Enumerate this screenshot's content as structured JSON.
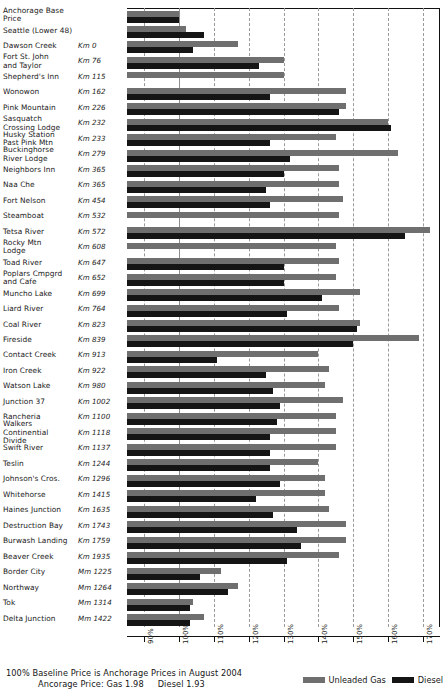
{
  "chart_data": {
    "type": "bar",
    "title": "",
    "orientation": "horizontal",
    "grouped": true,
    "xlabel": "",
    "ylabel": "",
    "xlim": [
      85,
      175
    ],
    "xticks": [
      "90%",
      "100%",
      "110%",
      "120%",
      "130%",
      "140%",
      "150%",
      "160%",
      "170%"
    ],
    "xtick_values": [
      90,
      100,
      110,
      120,
      130,
      140,
      150,
      160,
      170
    ],
    "grid": "vertical-dashed",
    "baseline_value": 100,
    "legend": [
      "Unleaded Gas",
      "Diesel"
    ],
    "legend_position": "bottom-right",
    "series": [
      {
        "name": "Unleaded Gas",
        "color": "#6f6f6f"
      },
      {
        "name": "Diesel",
        "color": "#151515"
      }
    ],
    "categories": [
      "Anchorage Base Price",
      "Seattle (Lower 48)",
      "Dawson Creek",
      "Fort St. John and Taylor",
      "Shepherd's Inn",
      "Wonowon",
      "Pink Mountain",
      "Sasquatch Crossing Lodge",
      "Husky Station Past Pink Mtn",
      "Buckinghorse River Lodge",
      "Neighbors Inn",
      "Naa Che",
      "Fort Nelson",
      "Steamboat",
      "Tetsa River",
      "Rocky Mtn Lodge",
      "Toad River",
      "Poplars Cmpgrd and Cafe",
      "Muncho Lake",
      "Liard River",
      "Coal River",
      "Fireside",
      "Contact Creek",
      "Iron Creek",
      "Watson Lake",
      "Junction 37",
      "Rancheria",
      "Walkers Continential Divide",
      "Swift River",
      "Teslin",
      "Johnson's Cros.",
      "Whitehorse",
      "Haines Junction",
      "Destruction Bay",
      "Burwash Landing",
      "Beaver Creek",
      "Border City",
      "Northway",
      "Tok",
      "Delta Junction"
    ],
    "rows": [
      {
        "name": "Anchorage Base\nPrice",
        "km": "",
        "gas": 100,
        "diesel": 100
      },
      {
        "name": "Seattle (Lower 48)",
        "km": "",
        "gas": 102,
        "diesel": 107
      },
      {
        "name": "Dawson Creek",
        "km": "Km 0",
        "gas": 117,
        "diesel": 104
      },
      {
        "name": "Fort St. John\nand Taylor",
        "km": "Km 76",
        "gas": 130,
        "diesel": 123
      },
      {
        "name": "Shepherd's Inn",
        "km": "Km 115",
        "gas": 130,
        "diesel": null
      },
      {
        "name": "Wonowon",
        "km": "Km 162",
        "gas": 148,
        "diesel": 126
      },
      {
        "name": "Pink Mountain",
        "km": "Km 226",
        "gas": 148,
        "diesel": 146
      },
      {
        "name": "Sasquatch\nCrossing Lodge",
        "km": "Km 232",
        "gas": 160,
        "diesel": 161
      },
      {
        "name": "Husky Station\nPast Pink Mtn",
        "km": "Km 233",
        "gas": 145,
        "diesel": 126
      },
      {
        "name": "Buckinghorse\nRiver Lodge",
        "km": "Km 279",
        "gas": 163,
        "diesel": 132
      },
      {
        "name": "Neighbors Inn",
        "km": "Km 365",
        "gas": 146,
        "diesel": 130
      },
      {
        "name": "Naa Che",
        "km": "Km 365",
        "gas": 146,
        "diesel": 125
      },
      {
        "name": "Fort Nelson",
        "km": "Km 454",
        "gas": 147,
        "diesel": 126
      },
      {
        "name": "Steamboat",
        "km": "Km 532",
        "gas": 146,
        "diesel": null
      },
      {
        "name": "Tetsa River",
        "km": "Km 572",
        "gas": 172,
        "diesel": 165
      },
      {
        "name": "Rocky Mtn\nLodge",
        "km": "Km 608",
        "gas": 145,
        "diesel": null
      },
      {
        "name": "Toad River",
        "km": "Km 647",
        "gas": 146,
        "diesel": 130
      },
      {
        "name": "Poplars Cmpgrd\nand Cafe",
        "km": "Km 652",
        "gas": 145,
        "diesel": 130
      },
      {
        "name": "Muncho Lake",
        "km": "Km 699",
        "gas": 152,
        "diesel": 141
      },
      {
        "name": "Liard River",
        "km": "Km 764",
        "gas": 146,
        "diesel": 131
      },
      {
        "name": "Coal River",
        "km": "Km 823",
        "gas": 152,
        "diesel": 151
      },
      {
        "name": "Fireside",
        "km": "Km 839",
        "gas": 169,
        "diesel": 150
      },
      {
        "name": "Contact Creek",
        "km": "Km 913",
        "gas": 140,
        "diesel": 111
      },
      {
        "name": "Iron Creek",
        "km": "Km 922",
        "gas": 143,
        "diesel": 125
      },
      {
        "name": "Watson Lake",
        "km": "Km 980",
        "gas": 142,
        "diesel": 127
      },
      {
        "name": "Junction 37",
        "km": "Km 1002",
        "gas": 147,
        "diesel": 129
      },
      {
        "name": "Rancheria",
        "km": "Km 1100",
        "gas": 145,
        "diesel": 128
      },
      {
        "name": "Walkers\nContinential\nDivide",
        "km": "Km 1118",
        "gas": 145,
        "diesel": 126
      },
      {
        "name": "Swift River",
        "km": "Km 1137",
        "gas": 145,
        "diesel": 126
      },
      {
        "name": "Teslin",
        "km": "Km 1244",
        "gas": 140,
        "diesel": 126
      },
      {
        "name": "Johnson's Cros.",
        "km": "Km 1296",
        "gas": 142,
        "diesel": 129
      },
      {
        "name": "Whitehorse",
        "km": "Km 1415",
        "gas": 142,
        "diesel": 122
      },
      {
        "name": "Haines Junction",
        "km": "Km 1635",
        "gas": 143,
        "diesel": 127
      },
      {
        "name": "Destruction Bay",
        "km": "Km 1743",
        "gas": 148,
        "diesel": 134
      },
      {
        "name": "Burwash Landing",
        "km": "Km 1759",
        "gas": 148,
        "diesel": 135
      },
      {
        "name": "Beaver Creek",
        "km": "Km 1935",
        "gas": 146,
        "diesel": 131
      },
      {
        "name": "Border City",
        "km": "Mm 1225",
        "gas": 112,
        "diesel": 106
      },
      {
        "name": "Northway",
        "km": "Mm 1264",
        "gas": 117,
        "diesel": 114
      },
      {
        "name": "Tok",
        "km": "Mm 1314",
        "gas": 104,
        "diesel": 103
      },
      {
        "name": "Delta Junction",
        "km": "Mm 1422",
        "gas": 107,
        "diesel": 103
      }
    ]
  },
  "footer": {
    "line1": "100% Baseline Price is Anchorage Prices in August 2004",
    "line2_prefix": "Ancorage Price:  Gas 1.98",
    "line2_suffix": "Diesel 1.93"
  },
  "legend": {
    "gas_label": "Unleaded Gas",
    "diesel_label": "Diesel"
  },
  "colors": {
    "gas": "#6f6f6f",
    "diesel": "#151515",
    "grid": "#9a9a9a",
    "baseline": "#8e8e8e",
    "axis": "#111111"
  }
}
